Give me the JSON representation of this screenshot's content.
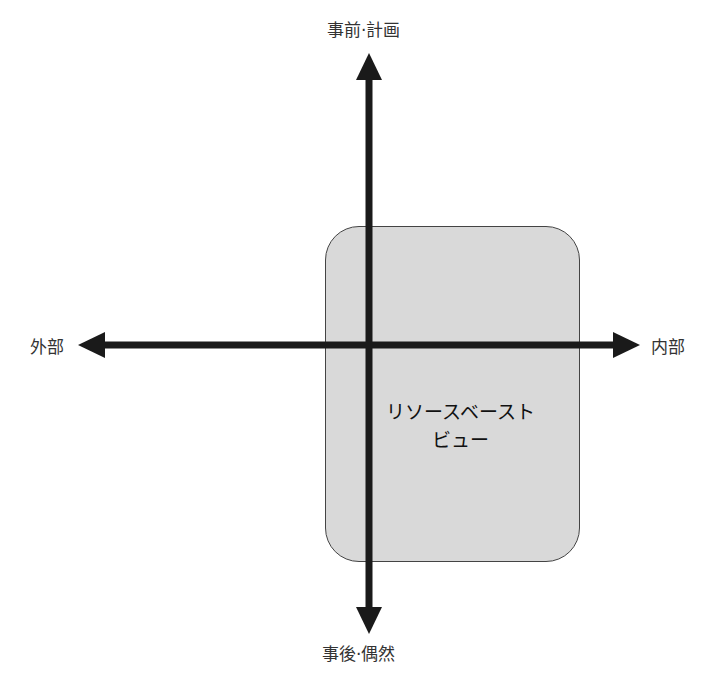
{
  "axes": {
    "top": "事前·計画",
    "bottom": "事後·偶然",
    "left": "外部",
    "right": "内部"
  },
  "region": {
    "line1": "リソースベースト",
    "line2": "ビュー",
    "fill": "#d9d9d9"
  }
}
